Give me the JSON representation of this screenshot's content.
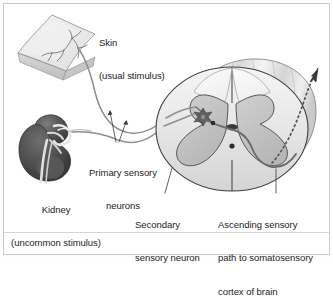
{
  "figure": {
    "domain": "anatomical-diagram",
    "background_color": "#fefefe",
    "border_color": "#c9c9c9",
    "ink_color": "#232323"
  },
  "labels": {
    "skin": {
      "line1": "Skin",
      "line2": "(usual stimulus)"
    },
    "kidney": {
      "line1": "Kidney",
      "line2": "(uncommon stimulus)"
    },
    "primary_neurons": {
      "line1": "Primary sensory",
      "line2": "neurons"
    },
    "secondary_neuron": {
      "line1": "Secondary",
      "line2": "sensory neuron"
    },
    "ascending_path": {
      "line1": "Ascending sensory",
      "line2": "path to somatosensory",
      "line3": "cortex of brain"
    }
  },
  "structures": {
    "skin_patch": {
      "name": "skin-patch",
      "fill": "#ececec",
      "edge_fill": "#d2d2d2",
      "stroke": "#8a8a8a"
    },
    "kidney": {
      "name": "kidney",
      "fill_dark": "#4a4a4a",
      "fill_mid": "#6e6e6e",
      "fill_light": "#bdbdbd",
      "stroke": "#3a3a3a"
    },
    "spinal_cord": {
      "name": "spinal-cord-cross-section",
      "white_matter_fill": "#f2f2f2",
      "gray_matter_fill": "#c6c6c6",
      "body_fill": "#e3e3e3",
      "stroke": "#3f3f3f"
    },
    "nerve_fiber": {
      "name": "nerve-fiber",
      "stroke": "#8f8f8f"
    },
    "ascending_tract": {
      "name": "ascending-tract",
      "stroke": "#555555",
      "style": "dotted"
    },
    "neuron_cell_body": {
      "name": "neuron-cell-body",
      "fill": "#5a5a5a"
    },
    "synapse": {
      "name": "synapse-point",
      "fill": "#2e2e2e"
    }
  }
}
